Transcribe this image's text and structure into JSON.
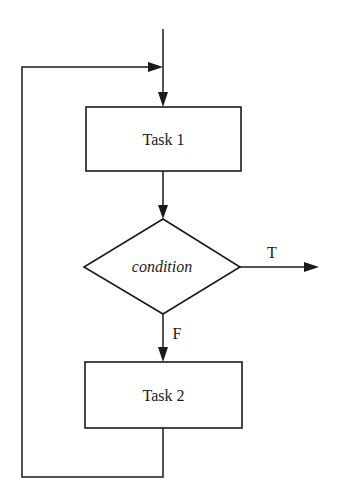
{
  "diagram": {
    "type": "flowchart",
    "nodes": [
      {
        "id": "task1",
        "shape": "rectangle",
        "label": "Task 1"
      },
      {
        "id": "condition",
        "shape": "diamond",
        "label": "condition"
      },
      {
        "id": "task2",
        "shape": "rectangle",
        "label": "Task 2"
      }
    ],
    "edges": [
      {
        "from": "entry",
        "to": "task1",
        "label": ""
      },
      {
        "from": "task1",
        "to": "condition",
        "label": ""
      },
      {
        "from": "condition",
        "to": "exit",
        "label": "T"
      },
      {
        "from": "condition",
        "to": "task2",
        "label": "F"
      },
      {
        "from": "task2",
        "to": "task1",
        "label": "",
        "kind": "loop-back"
      }
    ],
    "labels": {
      "task1": "Task 1",
      "condition": "condition",
      "task2": "Task 2",
      "true_branch": "T",
      "false_branch": "F"
    }
  }
}
